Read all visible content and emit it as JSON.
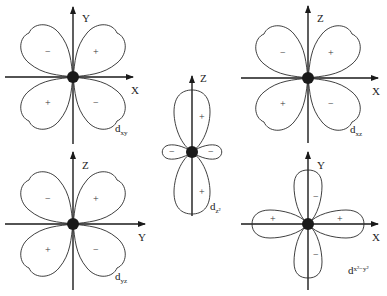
{
  "orbitals": [
    {
      "id": "dxy",
      "label_main": "d",
      "label_sub": "xy",
      "h_axis": "X",
      "v_axis": "Y",
      "signs": {
        "upper_left": "−",
        "upper_right": "+",
        "lower_left": "+",
        "lower_right": "−"
      }
    },
    {
      "id": "dz2",
      "label_main": "d",
      "label_sub": "z²",
      "v_axis": "Z",
      "signs": {
        "top": "+",
        "bottom": "+",
        "left": "−",
        "right": "−"
      }
    },
    {
      "id": "dxz",
      "label_main": "d",
      "label_sub": "xz",
      "h_axis": "X",
      "v_axis": "Z",
      "signs": {
        "upper_left": "−",
        "upper_right": "+",
        "lower_left": "+",
        "lower_right": "−"
      }
    },
    {
      "id": "dyz",
      "label_main": "d",
      "label_sub": "yz",
      "h_axis": "Y",
      "v_axis": "Z",
      "signs": {
        "upper_left": "−",
        "upper_right": "+",
        "lower_left": "+",
        "lower_right": "−"
      }
    },
    {
      "id": "dx2-y2",
      "label_main": "d",
      "label_sub": "x²−y²",
      "h_axis": "X",
      "v_axis": "Y",
      "signs": {
        "top": "−",
        "bottom": "−",
        "left": "+",
        "right": "+"
      }
    }
  ]
}
